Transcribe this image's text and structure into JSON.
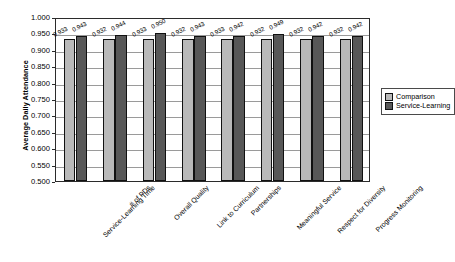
{
  "chart_data": {
    "type": "bar",
    "title": "",
    "xlabel": "",
    "ylabel": "Average Daily Attendance",
    "ylim": [
      0.5,
      1.0
    ],
    "ytick_step": 0.05,
    "grid": true,
    "legend_position": "right",
    "yticks": [
      "1.000",
      "0.950",
      "0.900",
      "0.850",
      "0.800",
      "0.750",
      "0.700",
      "0.650",
      "0.600",
      "0.550",
      "0.500"
    ],
    "categories": [
      "Service-Learning Time",
      "# of PDs",
      "Overall Quality",
      "Link to Curriculum",
      "Partnerships",
      "Meaningful Service",
      "Respect for Diversity",
      "Progress Monitoring"
    ],
    "series": [
      {
        "name": "Comparison",
        "color": "#b9b9b9",
        "values": [
          0.933,
          0.932,
          0.933,
          0.932,
          0.933,
          0.932,
          0.932,
          0.932
        ],
        "labels": [
          "0.933",
          "0.932",
          "0.933",
          "0.932",
          "0.933",
          "0.932",
          "0.932",
          "0.932"
        ]
      },
      {
        "name": "Service-Learning",
        "color": "#585858",
        "values": [
          0.943,
          0.944,
          0.95,
          0.943,
          0.942,
          0.949,
          0.942,
          0.942
        ],
        "labels": [
          "0.943",
          "0.944",
          "0.950",
          "0.943",
          "0.942",
          "0.949",
          "0.942",
          "0.942"
        ]
      }
    ]
  },
  "legend": {
    "items": [
      {
        "label": "Comparison"
      },
      {
        "label": "Service-Learning"
      }
    ]
  }
}
